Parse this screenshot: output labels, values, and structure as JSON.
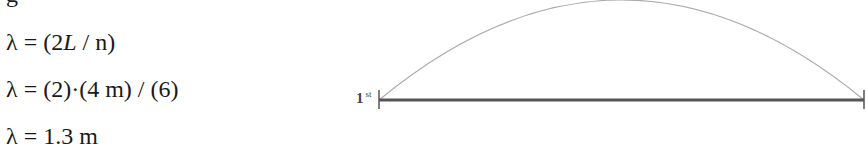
{
  "equations": [
    {
      "text": "g",
      "note": "clipped line at top"
    },
    {
      "prefix": "λ = (2",
      "italic": "L",
      "suffix": " / n)"
    },
    {
      "text": "λ = (2)·(4 m) / (6)"
    },
    {
      "text": "λ = 1.3 m"
    }
  ],
  "diagram": {
    "harmonic_label": "1",
    "harmonic_suffix": "st",
    "line_color": "#555555",
    "arc_color": "#aaaaaa",
    "line": {
      "x1": 379,
      "x2": 864,
      "y": 100
    },
    "arc_peak": {
      "x": 621,
      "y": 0
    }
  }
}
